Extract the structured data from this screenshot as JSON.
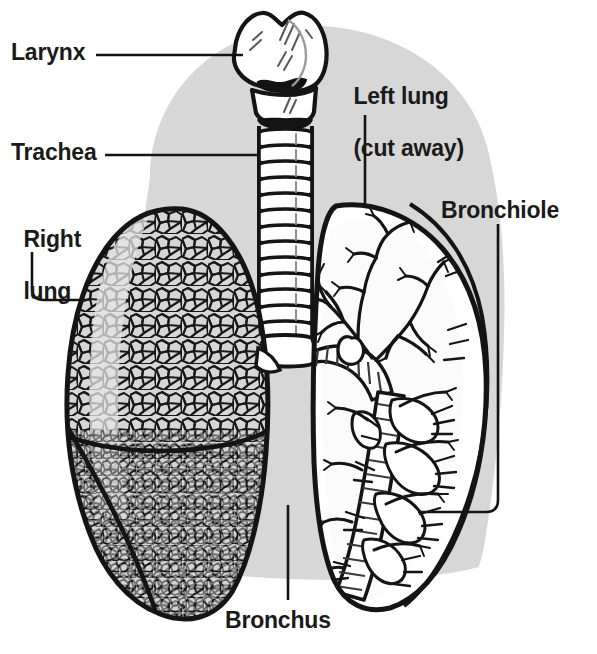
{
  "figure": {
    "type": "anatomical-line-diagram",
    "background_color": "#d9d9d9",
    "ink_color": "#1a1a1a",
    "paper_color": "#ffffff",
    "fill_color": "#ffffff",
    "tint_color": "#d0d0d0"
  },
  "labels": {
    "larynx": "Larynx",
    "trachea": "Trachea",
    "right_lung_line1": "Right",
    "right_lung_line2": "lung",
    "left_lung_line1": "Left lung",
    "left_lung_line2": "(cut away)",
    "bronchiole": "Bronchiole",
    "bronchus": "Bronchus"
  },
  "structures": [
    {
      "name": "larynx",
      "label": "Larynx",
      "side": "midline",
      "leader": "horizontal-left"
    },
    {
      "name": "trachea",
      "label": "Trachea",
      "side": "midline",
      "leader": "horizontal-left",
      "cartilage_rings": 14
    },
    {
      "name": "right-lung",
      "label": "Right lung",
      "side": "left-of-image",
      "leader": "elbow-down-right",
      "rendering": "alveolar-stipple",
      "lobes": 2
    },
    {
      "name": "left-lung",
      "label": "Left lung (cut away)",
      "side": "right-of-image",
      "leader": "vertical-down",
      "rendering": "cut-away-bronchial-tree"
    },
    {
      "name": "bronchiole",
      "label": "Bronchiole",
      "side": "right-of-image",
      "leader": "elbow-down-left"
    },
    {
      "name": "bronchus",
      "label": "Bronchus",
      "side": "midline-bottom",
      "leader": "vertical-up"
    }
  ]
}
